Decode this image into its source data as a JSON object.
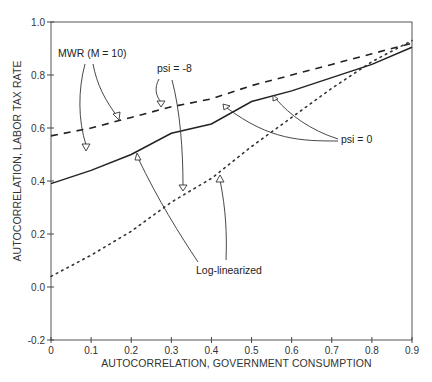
{
  "chart_data": {
    "type": "line",
    "title": "",
    "xlabel": "AUTOCORRELATION, GOVERNMENT CONSUMPTION",
    "ylabel": "AUTOCORRELATION, LABOR TAX RATE",
    "xlim": [
      0,
      0.9
    ],
    "ylim": [
      -0.2,
      1.0
    ],
    "grid": false,
    "legend": "none (inline annotations)",
    "x_ticks": [
      "0",
      "0.1",
      "0.2",
      "0.3",
      "0.4",
      "0.5",
      "0.6",
      "0.7",
      "0.8",
      "0.9"
    ],
    "y_ticks": [
      "-0.2",
      "0.0",
      "0.2",
      "0.4",
      "0.6",
      "0.8",
      "1.0"
    ],
    "x": [
      0,
      0.1,
      0.2,
      0.3,
      0.4,
      0.5,
      0.6,
      0.7,
      0.8,
      0.9
    ],
    "series": [
      {
        "name": "MWR (M = 10), psi = -8",
        "style": "dashed",
        "values": [
          0.57,
          0.6,
          0.64,
          0.68,
          0.71,
          0.76,
          0.8,
          0.84,
          0.88,
          0.92
        ]
      },
      {
        "name": "MWR (M = 10), psi = 0",
        "style": "solid",
        "values": [
          0.39,
          0.44,
          0.5,
          0.58,
          0.615,
          0.7,
          0.74,
          0.79,
          0.84,
          0.905
        ]
      },
      {
        "name": "Log-linearized",
        "style": "dotted",
        "values": [
          0.04,
          0.12,
          0.21,
          0.32,
          0.41,
          0.53,
          0.64,
          0.75,
          0.85,
          0.93
        ]
      }
    ],
    "annotations": {
      "mwr": "MWR (M = 10)",
      "psi_neg8": "psi = -8",
      "psi_0": "psi = 0",
      "loglin": "Log-linearized"
    }
  }
}
